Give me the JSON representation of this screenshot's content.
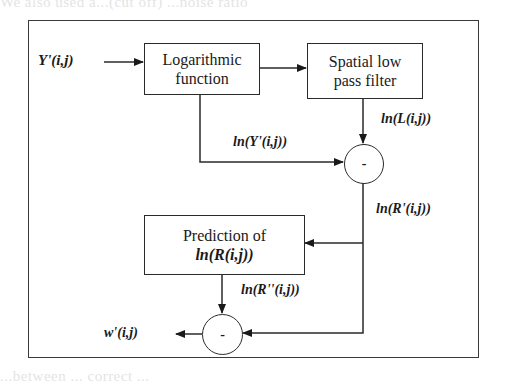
{
  "background_text": {
    "line1": "We also used a...(cut off) ...noise ratio",
    "line2": "...extracted watermarks...",
    "line_bottom": "...between ... correct ..."
  },
  "diagram": {
    "input_label": "Y'(i,j)",
    "blocks": {
      "logarithmic": {
        "line1": "Logarithmic",
        "line2": "function"
      },
      "spatial_lpf": {
        "line1": "Spatial low",
        "line2": "pass filter"
      },
      "prediction": {
        "line1": "Prediction of",
        "line2": "ln(R(i,j))"
      }
    },
    "signals": {
      "ln_L": "ln(L(i,j))",
      "ln_Y": "ln(Y'(i,j))",
      "ln_R_prime": "ln(R'(i,j))",
      "ln_R_double_prime": "ln(R''(i,j))"
    },
    "operators": {
      "subtract_top": "-",
      "subtract_bottom": "-"
    },
    "output_label": "w'(i,j)"
  }
}
